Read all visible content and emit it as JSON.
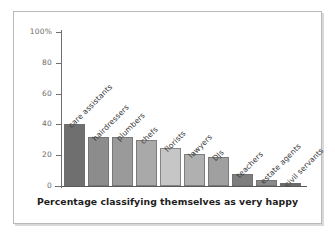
{
  "chart_data": {
    "type": "bar",
    "title": "",
    "xlabel": "Percentage classifying themselves as very happy",
    "ylabel": "",
    "ylim": [
      0,
      100
    ],
    "yticks": [
      0,
      20,
      40,
      60,
      80,
      100
    ],
    "ytick_labels": [
      "0",
      "20",
      "40",
      "60",
      "80",
      "100%"
    ],
    "grid": false,
    "legend": "none",
    "categories": [
      "care assistants",
      "hairdressers",
      "plumbers",
      "chefs",
      "florists",
      "lawyers",
      "DJs",
      "teachers",
      "estate agents",
      "civil servants"
    ],
    "values": [
      40,
      32,
      32,
      30,
      25,
      21,
      19,
      8,
      4,
      2
    ],
    "bar_colors": [
      "#6f6f6f",
      "#8c8c8c",
      "#9a9a9a",
      "#a9a9a9",
      "#c6c6c6",
      "#b0b0b0",
      "#a0a0a0",
      "#7e7e7e",
      "#8a8a8a",
      "#6a6a6a"
    ]
  },
  "axis": {
    "tick_color": "#6f6f6f",
    "label_color": "#6b6b6b"
  },
  "frame": {
    "border_color": "#b9b9b9"
  }
}
